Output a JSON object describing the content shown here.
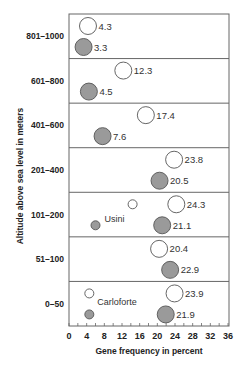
{
  "chart_data": {
    "type": "scatter",
    "subtype": "bubble-dot-plot",
    "title": "",
    "xlabel": "Gene frequency in percent",
    "ylabel": "Altitude above sea level in meters",
    "xlim": [
      0,
      36
    ],
    "x_ticks": [
      0,
      4,
      8,
      12,
      16,
      20,
      24,
      28,
      32,
      36
    ],
    "x_minor_tick_step": 2,
    "grid": false,
    "legend": null,
    "categories": [
      "801-1000",
      "601-800",
      "401-600",
      "201-400",
      "101-200",
      "51-100",
      "0-50"
    ],
    "category_labels": [
      "801–1000",
      "601–800",
      "401–600",
      "201–400",
      "101–200",
      "51–100",
      "0–50"
    ],
    "series": [
      {
        "name": "open circles",
        "style": "open",
        "values": [
          4.3,
          12.3,
          17.4,
          23.8,
          24.3,
          20.4,
          23.9
        ],
        "labels": [
          "4.3",
          "12.3",
          "17.4",
          "23.8",
          "24.3",
          "20.4",
          "23.9"
        ]
      },
      {
        "name": "filled circles",
        "style": "filled",
        "values": [
          3.3,
          4.5,
          7.6,
          20.5,
          21.1,
          22.9,
          21.9
        ],
        "labels": [
          "3.3",
          "4.5",
          "7.6",
          "20.5",
          "21.1",
          "22.9",
          "21.9"
        ]
      }
    ],
    "annotations": [
      {
        "text": "Usini",
        "row": "101-200",
        "open_value": 14.4,
        "filled_value": 6.0,
        "note": "small unlabeled circles"
      },
      {
        "text": "Carloforte",
        "row": "0-50",
        "open_value": 4.6,
        "filled_value": 4.6,
        "note": "small unlabeled circles"
      }
    ],
    "colors": {
      "filled": "#9a9a9a",
      "stroke": "#555555",
      "open_fill": "#ffffff",
      "frame": "#666666"
    }
  }
}
